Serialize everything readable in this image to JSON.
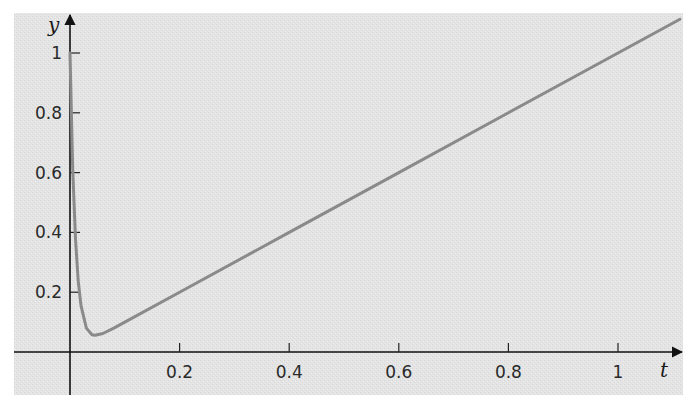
{
  "chart_data": {
    "type": "line",
    "title": "",
    "xlabel": "t",
    "ylabel": "y",
    "xlim": [
      -0.1,
      1.12
    ],
    "ylim": [
      -0.14,
      1.13
    ],
    "grid": false,
    "legend": null,
    "x_ticks": [
      0.2,
      0.4,
      0.6,
      0.8,
      1
    ],
    "x_tick_labels": [
      "0.2",
      "0.4",
      "0.6",
      "0.8",
      "1"
    ],
    "y_ticks": [
      0.2,
      0.4,
      0.6,
      0.8,
      1
    ],
    "y_tick_labels": [
      "0.2",
      "0.4",
      "0.6",
      "0.8",
      "1"
    ],
    "series": [
      {
        "name": "y(t)",
        "description": "Sharp drop from y=1 at t=0 to a minimum near t≈0.046, y≈0.056, then nearly linear growth y≈t",
        "x": [
          0,
          0.005,
          0.01,
          0.015,
          0.02,
          0.03,
          0.04,
          0.046,
          0.06,
          0.08,
          0.1,
          0.2,
          0.4,
          0.6,
          0.8,
          1.0,
          1.113
        ],
        "values": [
          1.0,
          0.612,
          0.378,
          0.238,
          0.155,
          0.08,
          0.058,
          0.056,
          0.062,
          0.08,
          0.1,
          0.2,
          0.4,
          0.6,
          0.8,
          1.0,
          1.113
        ]
      }
    ],
    "colors": {
      "background": "#e6e6e6",
      "curve": "#8a8a8a",
      "axes": "#111111"
    }
  }
}
